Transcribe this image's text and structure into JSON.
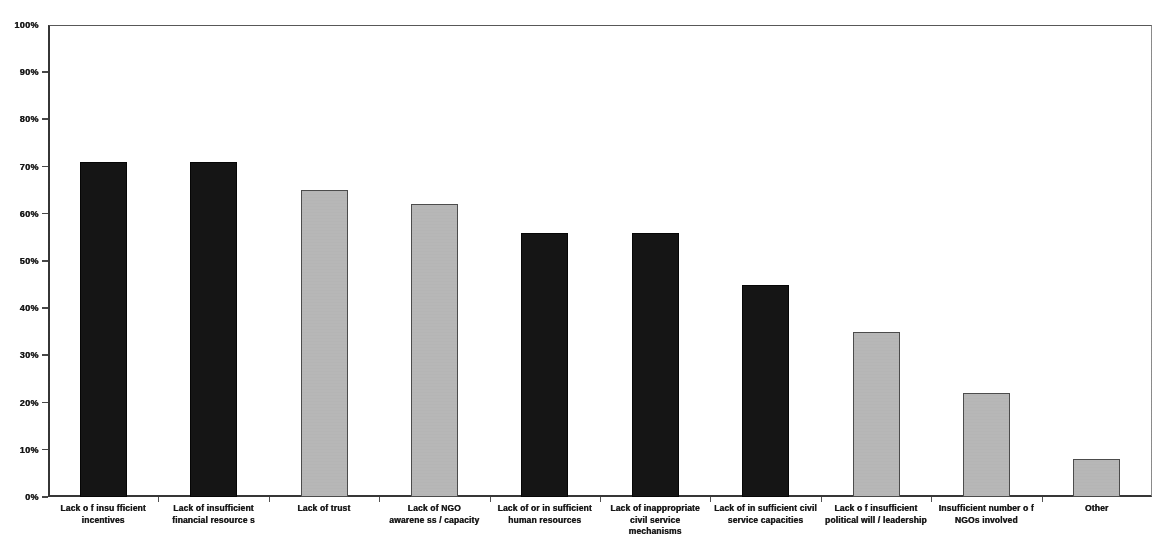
{
  "chart_data": {
    "type": "bar",
    "title": "",
    "subtitle": "",
    "xlabel": "",
    "ylabel": "",
    "ylim": [
      0,
      100
    ],
    "grid": false,
    "legend": "none",
    "y_tick_labels": [
      "100%",
      "90%",
      "80%",
      "70%",
      "60%",
      "50%",
      "40%",
      "30%",
      "20%",
      "10%",
      "0%"
    ],
    "y_tick_values": [
      100,
      90,
      80,
      70,
      60,
      50,
      40,
      30,
      20,
      10,
      0
    ],
    "categories": [
      "Lack of insufficient incentives",
      "Lack of insufficient financial resources",
      "Lack of trust",
      "Lack of NGO awareness / capacity",
      "Lack of or insufficient human resources",
      "Lack of inappropriate civil service mechanisms",
      "Lack of insufficient civil service capacities",
      "Lack of insufficient political will / leadership",
      "Insufficient number of NGOs involved",
      "Other"
    ],
    "category_lines": [
      [
        "Lack o f insu fficient",
        "incentives"
      ],
      [
        "Lack of insufficient",
        "financial resource s"
      ],
      [
        "Lack of trust"
      ],
      [
        "Lack of NGO",
        "awarene ss / capacity"
      ],
      [
        "Lack of or in sufficient",
        "human resources"
      ],
      [
        "Lack of inappropriate",
        "civil service",
        "mechanisms"
      ],
      [
        "Lack of in sufficient civil",
        "service capacities"
      ],
      [
        "Lack o f insufficient",
        "political will / leadership"
      ],
      [
        "Insufficient number o f",
        "NGOs involved"
      ],
      [
        "Other"
      ]
    ],
    "values": [
      71,
      71,
      65,
      62,
      56,
      56,
      45,
      35,
      22,
      8
    ],
    "bar_colors": [
      "#1b1b1b",
      "#1b1b1b",
      "#b4b4b4",
      "#b4b4b4",
      "#1b1b1b",
      "#1b1b1b",
      "#1b1b1b",
      "#b4b4b4",
      "#b4b4b4",
      "#b4b4b4"
    ],
    "bar_shades": [
      "dark",
      "dark",
      "light",
      "light",
      "dark",
      "dark",
      "dark",
      "light",
      "light",
      "light"
    ]
  }
}
